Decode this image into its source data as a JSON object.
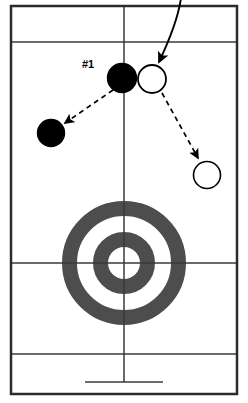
{
  "diagram": {
    "kind": "curling-sheet-tactics-diagram",
    "title": "",
    "canvas": {
      "width": 248,
      "height": 403,
      "background": "#ffffff"
    },
    "colors": {
      "line": "#3a3a3a",
      "border": "#2b2b2b",
      "house_ring": "#4d4d4d",
      "house_button": "#ffffff",
      "stone_dark_fill": "#000000",
      "stone_light_fill": "#ffffff",
      "stone_stroke": "#000000",
      "motion_path": "#000000"
    },
    "sheet": {
      "border": {
        "x": 11,
        "y": 6,
        "width": 226,
        "height": 388,
        "stroke_width": 2.5
      },
      "center_line": {
        "x": 124,
        "y1": 6,
        "y2": 394,
        "stroke_width": 1.4
      },
      "hog_line": {
        "y": 42,
        "x1": 11,
        "x2": 237,
        "stroke_width": 1.6
      },
      "tee_line": {
        "y": 263,
        "x1": 11,
        "x2": 237,
        "stroke_width": 1.2
      },
      "back_line": {
        "y": 354,
        "x1": 11,
        "x2": 237,
        "stroke_width": 1.2
      },
      "hack": {
        "x": 124,
        "y_top": 354,
        "y_bottom": 382,
        "bar_x1": 85,
        "bar_x2": 163,
        "stroke_width": 1.6
      }
    },
    "house": {
      "center": {
        "x": 124,
        "y": 263
      },
      "rings": [
        {
          "name": "twelve-foot",
          "radius": 62,
          "thickness": 15,
          "color": "#4d4d4d"
        },
        {
          "name": "four-foot",
          "radius": 31,
          "thickness": 15,
          "color": "#4d4d4d"
        }
      ],
      "button_radius": 14
    },
    "stones": [
      {
        "id": "stationary-dark-stone",
        "type": "dark",
        "label": "#1",
        "cx": 122,
        "cy": 78,
        "r": 14.5
      },
      {
        "id": "delivered-light-stone",
        "type": "light",
        "label": "",
        "cx": 152,
        "cy": 79,
        "r": 14.5
      },
      {
        "id": "resulting-dark-stone",
        "type": "dark",
        "label": "",
        "cx": 51,
        "cy": 133,
        "r": 13.5
      },
      {
        "id": "resulting-light-stone",
        "type": "light",
        "label": "",
        "cx": 207,
        "cy": 175,
        "r": 14
      }
    ],
    "paths": {
      "delivery": {
        "name": "delivery-curve",
        "style": "solid",
        "d": "M 180 0 C 176 22 166 44 159 63",
        "arrow_at": {
          "x": 159,
          "y": 66
        },
        "arrow_angle_deg": 110
      },
      "dark_stone_travel": {
        "name": "dark-stone-travel-arrow",
        "style": "dashed",
        "x1": 114,
        "y1": 90,
        "x2": 66,
        "y2": 124,
        "dash": "5,4"
      },
      "light_stone_travel": {
        "name": "light-stone-travel-arrow",
        "style": "dashed",
        "x1": 161,
        "y1": 92,
        "x2": 199,
        "y2": 159,
        "dash": "5,4"
      }
    },
    "labels": {
      "shot_number": "#1"
    }
  }
}
